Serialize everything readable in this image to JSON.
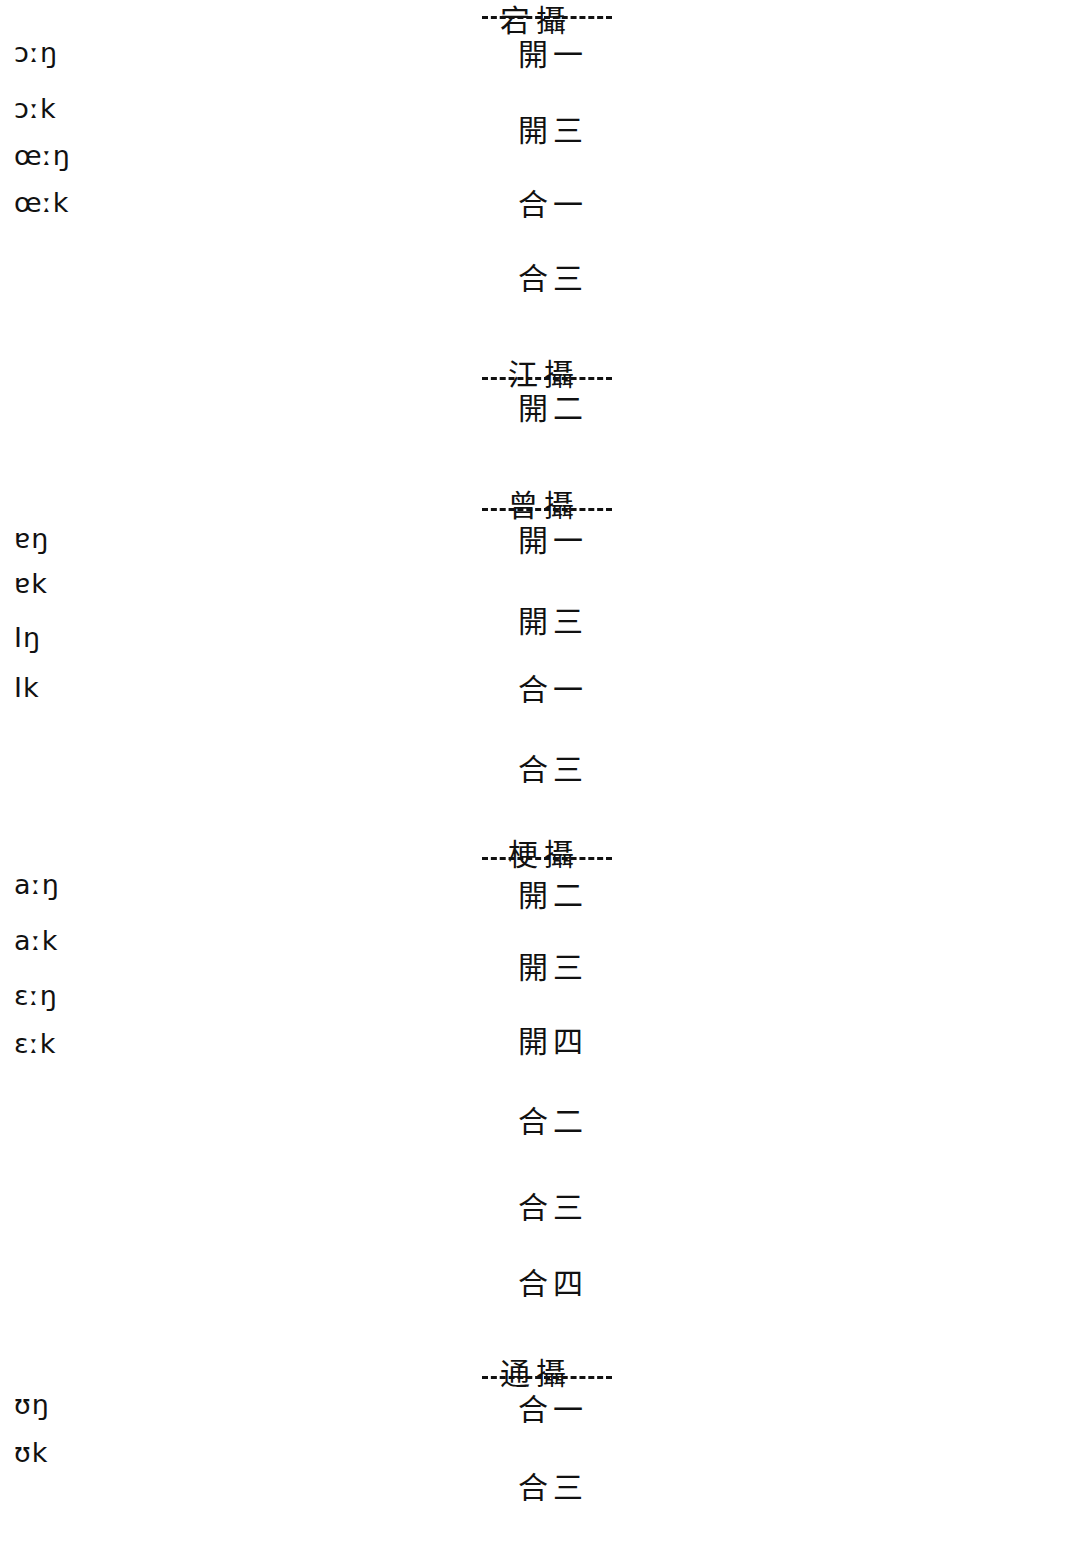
{
  "diagram": {
    "columns": {
      "left_label": "Cantonese rhymes",
      "middle_label": "Middle Chinese rime classes",
      "right_label": "Mandarin rhymes"
    },
    "section_headers": [
      {
        "id": "dang",
        "text": "宕攝",
        "x": 500,
        "y": 4,
        "rule_x": 482,
        "rule_w": 130,
        "rule_y": 16
      },
      {
        "id": "jiang",
        "text": "江攝",
        "x": 508,
        "y": 358,
        "rule_x": 482,
        "rule_w": 130,
        "rule_y": 377
      },
      {
        "id": "zeng",
        "text": "曾攝",
        "x": 508,
        "y": 489,
        "rule_x": 482,
        "rule_w": 130,
        "rule_y": 508
      },
      {
        "id": "geng",
        "text": "梗攝",
        "x": 508,
        "y": 838,
        "rule_x": 482,
        "rule_w": 130,
        "rule_y": 857
      },
      {
        "id": "tong",
        "text": "通攝",
        "x": 500,
        "y": 1357,
        "rule_x": 482,
        "rule_w": 130,
        "rule_y": 1376
      }
    ],
    "left_nodes": [
      {
        "id": "L1",
        "text": "ɔːŋ",
        "x": 14,
        "y": 52
      },
      {
        "id": "L2",
        "text": "ɔːk",
        "x": 14,
        "y": 108
      },
      {
        "id": "L3",
        "text": "œːŋ",
        "x": 14,
        "y": 155
      },
      {
        "id": "L4",
        "text": "œːk",
        "x": 14,
        "y": 202
      },
      {
        "id": "L5",
        "text": "ɐŋ",
        "x": 14,
        "y": 538
      },
      {
        "id": "L6",
        "text": "ɐk",
        "x": 14,
        "y": 583
      },
      {
        "id": "L7",
        "text": "Iŋ",
        "x": 14,
        "y": 637
      },
      {
        "id": "L8",
        "text": "Ik",
        "x": 14,
        "y": 687
      },
      {
        "id": "L9",
        "text": "aːŋ",
        "x": 14,
        "y": 884
      },
      {
        "id": "L10",
        "text": "aːk",
        "x": 14,
        "y": 940
      },
      {
        "id": "L11",
        "text": "ɛːŋ",
        "x": 14,
        "y": 995
      },
      {
        "id": "L12",
        "text": "ɛːk",
        "x": 14,
        "y": 1043
      },
      {
        "id": "L13",
        "text": "ʊŋ",
        "x": 14,
        "y": 1404
      },
      {
        "id": "L14",
        "text": "ʊk",
        "x": 14,
        "y": 1452
      }
    ],
    "middle_nodes": [
      {
        "id": "M1",
        "text": "開一",
        "x": 518,
        "y": 55,
        "section": "dang"
      },
      {
        "id": "M2",
        "text": "開三",
        "x": 518,
        "y": 131,
        "section": "dang"
      },
      {
        "id": "M3",
        "text": "合一",
        "x": 518,
        "y": 205,
        "section": "dang"
      },
      {
        "id": "M4",
        "text": "合三",
        "x": 518,
        "y": 279,
        "section": "dang"
      },
      {
        "id": "M5",
        "text": "開二",
        "x": 518,
        "y": 409,
        "section": "jiang"
      },
      {
        "id": "M6",
        "text": "開一",
        "x": 518,
        "y": 541,
        "section": "zeng"
      },
      {
        "id": "M7",
        "text": "開三",
        "x": 518,
        "y": 622,
        "section": "zeng"
      },
      {
        "id": "M8",
        "text": "合一",
        "x": 518,
        "y": 690,
        "section": "zeng"
      },
      {
        "id": "M9",
        "text": "合三",
        "x": 518,
        "y": 770,
        "section": "zeng"
      },
      {
        "id": "M10",
        "text": "開二",
        "x": 518,
        "y": 896,
        "section": "geng"
      },
      {
        "id": "M11",
        "text": "開三",
        "x": 518,
        "y": 968,
        "section": "geng"
      },
      {
        "id": "M12",
        "text": "開四",
        "x": 518,
        "y": 1042,
        "section": "geng"
      },
      {
        "id": "M13",
        "text": "合二",
        "x": 518,
        "y": 1122,
        "section": "geng"
      },
      {
        "id": "M14",
        "text": "合三",
        "x": 518,
        "y": 1208,
        "section": "geng"
      },
      {
        "id": "M15",
        "text": "合四",
        "x": 518,
        "y": 1284,
        "section": "geng"
      },
      {
        "id": "M16",
        "text": "合一",
        "x": 518,
        "y": 1410,
        "section": "tong"
      },
      {
        "id": "M17",
        "text": "合三",
        "x": 518,
        "y": 1488,
        "section": "tong"
      }
    ],
    "right_nodes": [
      {
        "id": "R1",
        "text": "aŋ",
        "x": 1034,
        "y": 62
      },
      {
        "id": "R2",
        "text": "iaŋ",
        "x": 1022,
        "y": 137
      },
      {
        "id": "R3",
        "text": "uaŋ",
        "x": 1016,
        "y": 190
      },
      {
        "id": "R4",
        "text": "uo",
        "x": 1030,
        "y": 268
      },
      {
        "id": "R5",
        "text": "au",
        "x": 1030,
        "y": 343
      },
      {
        "id": "R6",
        "text": "iau",
        "x": 1022,
        "y": 393
      },
      {
        "id": "R7",
        "text": "ye",
        "x": 1028,
        "y": 467
      },
      {
        "id": "R8",
        "text": "əŋ",
        "x": 1034,
        "y": 547
      },
      {
        "id": "R9",
        "text": "iŋ",
        "x": 1034,
        "y": 626
      },
      {
        "id": "R10",
        "text": "ɣ",
        "x": 1036,
        "y": 728
      },
      {
        "id": "R11",
        "text": "ei",
        "x": 1032,
        "y": 796
      },
      {
        "id": "R12",
        "text": "ai",
        "x": 1032,
        "y": 872
      },
      {
        "id": "R13",
        "text": "ï",
        "x": 1036,
        "y": 968
      },
      {
        "id": "R14",
        "text": "i",
        "x": 1036,
        "y": 1046
      },
      {
        "id": "R15",
        "text": "y",
        "x": 1030,
        "y": 1209
      },
      {
        "id": "R16",
        "text": "yuŋ",
        "x": 1008,
        "y": 1355
      },
      {
        "id": "R17",
        "text": "uŋ",
        "x": 1026,
        "y": 1408
      },
      {
        "id": "R18",
        "text": "u",
        "x": 1030,
        "y": 1490
      },
      {
        "id": "R19",
        "text": "ou",
        "x": 1024,
        "y": 1540
      }
    ],
    "left_edges": [
      [
        "M1",
        "L1"
      ],
      [
        "M1",
        "L2"
      ],
      [
        "M2",
        "L3"
      ],
      [
        "M2",
        "L4"
      ],
      [
        "M2",
        "L2"
      ],
      [
        "M3",
        "L1"
      ],
      [
        "M3",
        "L2"
      ],
      [
        "M4",
        "L3"
      ],
      [
        "M4",
        "L4"
      ],
      [
        "M4",
        "L2"
      ],
      [
        "M5",
        "L1"
      ],
      [
        "M5",
        "L2"
      ],
      [
        "M5",
        "L3"
      ],
      [
        "M5",
        "L4"
      ],
      [
        "M5",
        "L9"
      ],
      [
        "M5",
        "L10"
      ],
      [
        "M6",
        "L5"
      ],
      [
        "M6",
        "L6"
      ],
      [
        "M7",
        "L7"
      ],
      [
        "M7",
        "L8"
      ],
      [
        "M7",
        "L5"
      ],
      [
        "M8",
        "L7"
      ],
      [
        "M8",
        "L8"
      ],
      [
        "M8",
        "L5"
      ],
      [
        "M9",
        "L7"
      ],
      [
        "M9",
        "L8"
      ],
      [
        "M10",
        "L9"
      ],
      [
        "M10",
        "L10"
      ],
      [
        "M10",
        "L5"
      ],
      [
        "M10",
        "L6"
      ],
      [
        "M11",
        "L9"
      ],
      [
        "M11",
        "L10"
      ],
      [
        "M11",
        "L7"
      ],
      [
        "M11",
        "L8"
      ],
      [
        "M11",
        "L11"
      ],
      [
        "M11",
        "L12"
      ],
      [
        "M12",
        "L11"
      ],
      [
        "M12",
        "L12"
      ],
      [
        "M12",
        "L7"
      ],
      [
        "M12",
        "L8"
      ],
      [
        "M13",
        "L8"
      ],
      [
        "M13",
        "L10"
      ],
      [
        "M14",
        "L8"
      ],
      [
        "M14",
        "L7"
      ],
      [
        "M15",
        "L8"
      ],
      [
        "M16",
        "L13"
      ],
      [
        "M16",
        "L14"
      ],
      [
        "M17",
        "L13"
      ],
      [
        "M17",
        "L14"
      ],
      [
        "M4",
        "L13"
      ],
      [
        "M9",
        "L14"
      ]
    ],
    "right_edges": [
      [
        "M1",
        "R1"
      ],
      [
        "M1",
        "R4"
      ],
      [
        "M1",
        "R5"
      ],
      [
        "M2",
        "R1"
      ],
      [
        "M2",
        "R2"
      ],
      [
        "M2",
        "R3"
      ],
      [
        "M2",
        "R4"
      ],
      [
        "M2",
        "R6"
      ],
      [
        "M2",
        "R7"
      ],
      [
        "M3",
        "R1"
      ],
      [
        "M3",
        "R4"
      ],
      [
        "M4",
        "R3"
      ],
      [
        "M4",
        "R1"
      ],
      [
        "M4",
        "R4"
      ],
      [
        "M4",
        "R7"
      ],
      [
        "M5",
        "R1"
      ],
      [
        "M5",
        "R3"
      ],
      [
        "M5",
        "R4"
      ],
      [
        "M5",
        "R5"
      ],
      [
        "M5",
        "R6"
      ],
      [
        "M5",
        "R7"
      ],
      [
        "M6",
        "R8"
      ],
      [
        "M6",
        "R10"
      ],
      [
        "M6",
        "R12"
      ],
      [
        "M7",
        "R8"
      ],
      [
        "M7",
        "R9"
      ],
      [
        "M7",
        "R10"
      ],
      [
        "M7",
        "R11"
      ],
      [
        "M7",
        "R13"
      ],
      [
        "M7",
        "R14"
      ],
      [
        "M8",
        "R8"
      ],
      [
        "M8",
        "R10"
      ],
      [
        "M9",
        "R9"
      ],
      [
        "M9",
        "R10"
      ],
      [
        "M9",
        "R15"
      ],
      [
        "M10",
        "R8"
      ],
      [
        "M10",
        "R9"
      ],
      [
        "M10",
        "R10"
      ],
      [
        "M10",
        "R12"
      ],
      [
        "M11",
        "R9"
      ],
      [
        "M11",
        "R8"
      ],
      [
        "M11",
        "R10"
      ],
      [
        "M11",
        "R14"
      ],
      [
        "M12",
        "R9"
      ],
      [
        "M12",
        "R14"
      ],
      [
        "M13",
        "R17"
      ],
      [
        "M13",
        "R16"
      ],
      [
        "M14",
        "R9"
      ],
      [
        "M14",
        "R16"
      ],
      [
        "M14",
        "R15"
      ],
      [
        "M15",
        "R15"
      ],
      [
        "M15",
        "R16"
      ],
      [
        "M16",
        "R17"
      ],
      [
        "M16",
        "R18"
      ],
      [
        "M16",
        "R16"
      ],
      [
        "M17",
        "R16"
      ],
      [
        "M17",
        "R17"
      ],
      [
        "M17",
        "R18"
      ],
      [
        "M17",
        "R19"
      ],
      [
        "M17",
        "R15"
      ]
    ]
  }
}
